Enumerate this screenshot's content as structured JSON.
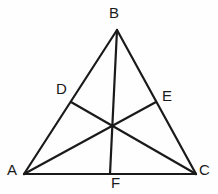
{
  "figure": {
    "kind": "geometry-diagram",
    "background_color": "#fefefe",
    "stroke_color": "#1a1a1a",
    "label_color": "#1a1a1a",
    "stroke_width": 2,
    "canvas": {
      "width": 218,
      "height": 194
    }
  },
  "points": {
    "A": {
      "label": "A",
      "x": 24,
      "y": 174
    },
    "B": {
      "label": "B",
      "x": 117,
      "y": 30
    },
    "C": {
      "label": "C",
      "x": 196,
      "y": 174
    },
    "D": {
      "label": "D",
      "x": 71,
      "y": 102
    },
    "E": {
      "label": "E",
      "x": 156,
      "y": 102
    },
    "F": {
      "label": "F",
      "x": 110,
      "y": 174
    },
    "centroid": {
      "label": "",
      "x": 112,
      "y": 126
    }
  },
  "segments": [
    {
      "name": "side-AB",
      "from": "A",
      "to": "B"
    },
    {
      "name": "side-BC",
      "from": "B",
      "to": "C"
    },
    {
      "name": "side-AC",
      "from": "A",
      "to": "C"
    },
    {
      "name": "median-BF",
      "from": "B",
      "to": "F"
    },
    {
      "name": "median-AE",
      "from": "A",
      "to": "E"
    },
    {
      "name": "median-CD",
      "from": "C",
      "to": "D"
    }
  ],
  "labels": {
    "A": "A",
    "B": "B",
    "C": "C",
    "D": "D",
    "E": "E",
    "F": "F"
  }
}
